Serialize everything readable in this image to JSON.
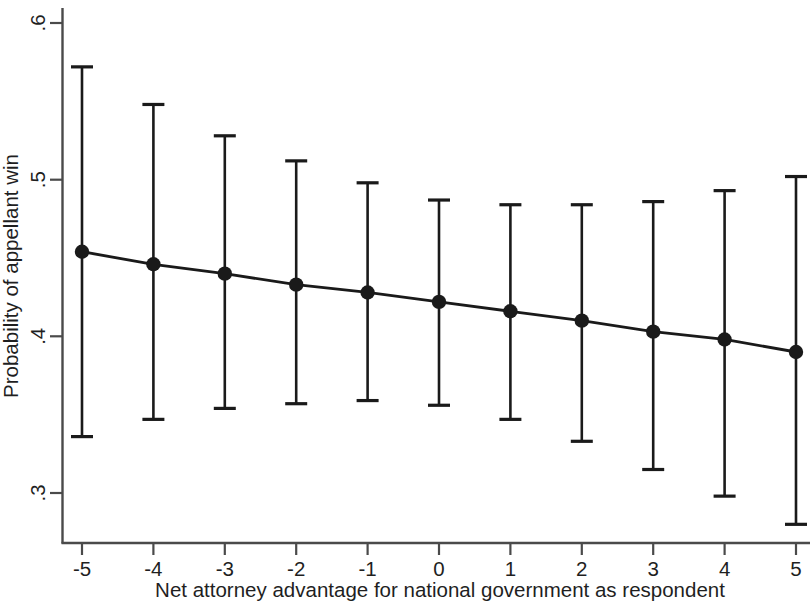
{
  "chart_data": {
    "type": "line",
    "title": "",
    "subtitle": "",
    "xlabel": "Net attorney advantage for national government as respondent",
    "ylabel": "Probability of appellant win",
    "x": [
      -5,
      -4,
      -3,
      -2,
      -1,
      0,
      1,
      2,
      3,
      4,
      5
    ],
    "values": [
      0.454,
      0.446,
      0.44,
      0.433,
      0.428,
      0.422,
      0.416,
      0.41,
      0.403,
      0.398,
      0.39
    ],
    "ci_lower": [
      0.336,
      0.347,
      0.354,
      0.357,
      0.359,
      0.356,
      0.347,
      0.333,
      0.315,
      0.298,
      0.28
    ],
    "ci_upper": [
      0.572,
      0.548,
      0.528,
      0.512,
      0.498,
      0.487,
      0.484,
      0.484,
      0.486,
      0.493,
      0.502
    ],
    "xlim": [
      -5.35,
      5.35
    ],
    "ylim": [
      0.277,
      0.613
    ],
    "xticks": [
      -5,
      -4,
      -3,
      -2,
      -1,
      0,
      1,
      2,
      3,
      4,
      5
    ],
    "xtick_labels": [
      "-5",
      "-4",
      "-3",
      "-2",
      "-1",
      "0",
      "1",
      "2",
      "3",
      "4",
      "5"
    ],
    "yticks": [
      0.3,
      0.4,
      0.5,
      0.6
    ],
    "ytick_labels": [
      ".3",
      ".4",
      ".5",
      ".6"
    ],
    "grid": false,
    "legend": null,
    "series_name": "Predicted probability with 95% confidence interval",
    "marker": "filled-circle",
    "line_color": "#1a1a1a",
    "marker_color": "#1a1a1a",
    "errorbar_color": "#1a1a1a",
    "background_color": "#ffffff"
  },
  "axes": {
    "y_title": "Probability of appellant win",
    "x_title": "Net attorney advantage for national government as respondent",
    "y_tick_labels": [
      ".6",
      ".5",
      ".4",
      ".3"
    ],
    "x_tick_labels": [
      "-5",
      "-4",
      "-3",
      "-2",
      "-1",
      "0",
      "1",
      "2",
      "3",
      "4",
      "5"
    ]
  }
}
